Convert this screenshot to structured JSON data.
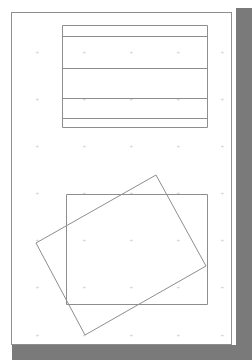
{
  "document": {
    "title": "Scanned technical drawing sheet",
    "background_color": "#ffffff",
    "sheet_color": "#ffffff",
    "shadow_color": "#7a7a7a",
    "line_color": "#8e8e8e",
    "grid_dot_color": "#c9c9c9"
  },
  "sheet": {
    "x": 4,
    "y": 2,
    "width": 232,
    "height": 343
  },
  "frame": {
    "label": "drawing-frame",
    "x": 7,
    "y": 10,
    "width": 221,
    "height": 333
  },
  "grid": {
    "label": "snap-dot-grid",
    "glyph": "+",
    "x_positions": [
      33,
      80,
      127,
      174,
      218
    ],
    "y_positions": [
      50,
      97,
      144,
      191,
      238,
      285,
      333
    ],
    "spacing": 47
  },
  "shapes": [
    {
      "name": "table-rectangle",
      "type": "rect",
      "x": 62,
      "y": 25,
      "width": 145,
      "height": 102,
      "row_divider_y": [
        36,
        68,
        98,
        118
      ],
      "rows": 5
    },
    {
      "name": "aligned-rectangle",
      "type": "rect",
      "x": 66,
      "y": 194,
      "width": 141,
      "height": 110
    },
    {
      "name": "rotated-rectangle",
      "type": "polygon",
      "points": "156,175 206,266 85,335 36,243",
      "rotation_deg": -28
    }
  ],
  "shadow": {
    "right": {
      "x": 236,
      "y": 8,
      "width": 16,
      "height": 352
    },
    "bottom": {
      "x": 12,
      "y": 344,
      "width": 240,
      "height": 16
    }
  }
}
